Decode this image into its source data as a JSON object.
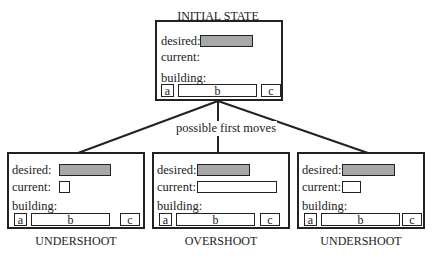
{
  "diagram": {
    "root": {
      "title": "INITIAL STATE",
      "labels": {
        "desired": "desired:",
        "current": "current:",
        "building": "building:"
      },
      "current_fill": "empty",
      "blocks": [
        "a",
        "b",
        "c"
      ]
    },
    "edge_label": "possible first moves",
    "children": [
      {
        "caption": "UNDERSHOOT",
        "labels": {
          "desired": "desired:",
          "current": "current:",
          "building": "building:"
        },
        "current_relative_to_desired": "shorter",
        "blocks": [
          "a",
          "b",
          "c"
        ]
      },
      {
        "caption": "OVERSHOOT",
        "labels": {
          "desired": "desired:",
          "current": "current:",
          "building": "building:"
        },
        "current_relative_to_desired": "longer",
        "blocks": [
          "a",
          "b",
          "c"
        ]
      },
      {
        "caption": "UNDERSHOOT",
        "labels": {
          "desired": "desired:",
          "current": "current:",
          "building": "building:"
        },
        "current_relative_to_desired": "shorter",
        "blocks": [
          "a",
          "b",
          "c"
        ]
      }
    ],
    "colors": {
      "desired_fill": "#a8a8a8",
      "stroke": "#222222"
    }
  }
}
